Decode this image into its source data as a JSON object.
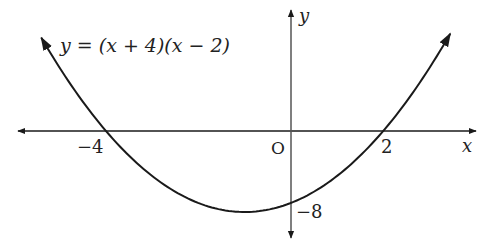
{
  "chart_data": {
    "type": "line",
    "title": "",
    "equation": "y = (x + 4)(x − 2)",
    "xlabel": "x",
    "ylabel": "y",
    "origin_label": "O",
    "annotations": [
      {
        "text": "−4",
        "x": -4,
        "y": 0,
        "meaning": "x-intercept"
      },
      {
        "text": "2",
        "x": 2,
        "y": 0,
        "meaning": "x-intercept"
      },
      {
        "text": "−8",
        "x": 0,
        "y": -8,
        "meaning": "y-intercept"
      }
    ],
    "series": [
      {
        "name": "y = (x + 4)(x − 2)",
        "x": [
          -5.4,
          -5,
          -4,
          -3,
          -2,
          -1,
          0,
          1,
          2,
          3,
          3.45
        ],
        "values": [
          10.6,
          7,
          0,
          -5,
          -8,
          -9,
          -8,
          -5,
          0,
          7,
          10.8
        ]
      }
    ],
    "xlim": [
      -6,
      4.1
    ],
    "ylim": [
      -11.8,
      13.5
    ],
    "grid": false,
    "legend": "none",
    "color": "#1a1a1a"
  },
  "labels": {
    "equation": "y = (x + 4)(x − 2)",
    "x_axis": "x",
    "y_axis": "y",
    "origin": "O",
    "tick_neg4": "−4",
    "tick_2": "2",
    "tick_neg8": "−8"
  }
}
